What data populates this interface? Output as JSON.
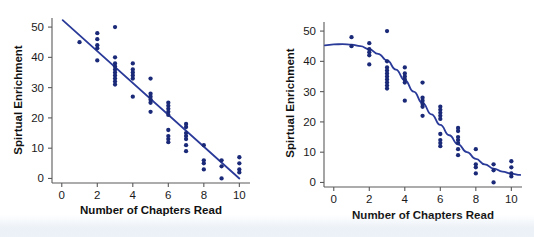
{
  "figure": {
    "background_color": "#ffffff",
    "point_color": "#1b2a78",
    "line_color": "#2a3a99",
    "axis_color": "#5a5a5a"
  },
  "chart_data": [
    {
      "type": "scatter",
      "panel": "left",
      "title": "",
      "xlabel": "Number of Chapters Read",
      "ylabel": "Spirtual Enrichment",
      "xlim": [
        -0.55,
        10.6
      ],
      "ylim": [
        -1.5,
        53
      ],
      "xticks": [
        0,
        2,
        4,
        6,
        8,
        10
      ],
      "yticks": [
        0,
        10,
        20,
        30,
        40,
        50
      ],
      "xtick_labels": [
        "0",
        "2",
        "4",
        "6",
        "8",
        "10"
      ],
      "ytick_labels": [
        "0",
        "10",
        "20",
        "30",
        "40",
        "50"
      ],
      "grid": false,
      "legend": "none",
      "fit": {
        "kind": "line",
        "label": "least-squares straight line",
        "x_start": 0.05,
        "y_start": 52.3,
        "x_end": 10.0,
        "y_end": 0.0,
        "slope": -5.26,
        "intercept": 52.6
      },
      "x": [
        1,
        2,
        2,
        2,
        2,
        2,
        3,
        3,
        3,
        3,
        3,
        3,
        3,
        3,
        3,
        3,
        4,
        4,
        4,
        4,
        4,
        4,
        5,
        5,
        5,
        5,
        5,
        5,
        6,
        6,
        6,
        6,
        6,
        6,
        6,
        6,
        6,
        7,
        7,
        7,
        7,
        7,
        7,
        7,
        8,
        8,
        8,
        8,
        9,
        9,
        9,
        10,
        10,
        10,
        10
      ],
      "y": [
        45,
        48,
        46,
        44,
        43,
        39,
        50,
        40,
        38,
        37,
        36,
        35,
        34,
        33,
        32,
        31,
        38,
        36,
        35,
        34,
        33,
        27,
        33,
        28,
        27,
        26,
        25,
        22,
        25,
        24,
        23,
        22,
        21,
        16,
        14,
        13,
        12,
        18,
        17,
        15,
        14,
        13,
        11,
        9,
        11,
        6,
        5,
        3,
        6,
        4,
        0,
        7,
        5,
        3,
        2
      ]
    },
    {
      "type": "scatter",
      "panel": "right",
      "title": "",
      "xlabel": "Number of Chapters Read",
      "ylabel": "Spirtual Enrichment",
      "xlim": [
        -0.55,
        10.6
      ],
      "ylim": [
        -1.5,
        53
      ],
      "xticks": [
        0,
        2,
        4,
        6,
        8,
        10
      ],
      "yticks": [
        0,
        10,
        20,
        30,
        40,
        50
      ],
      "xtick_labels": [
        "0",
        "2",
        "4",
        "6",
        "8",
        "10"
      ],
      "ytick_labels": [
        "0",
        "10",
        "20",
        "30",
        "40",
        "50"
      ],
      "grid": false,
      "legend": "none",
      "fit": {
        "kind": "logistic-curve",
        "label": "smooth S-shaped (sigmoid) curve",
        "upper_asymptote": 46,
        "lower_asymptote": 2.3,
        "midpoint_x": 5.6,
        "steepness": 0.78,
        "sample_points": [
          [
            -0.5,
            45.3
          ],
          [
            0,
            45.6
          ],
          [
            0.5,
            45.7
          ],
          [
            1,
            45.5
          ],
          [
            1.5,
            45.0
          ],
          [
            2,
            44.0
          ],
          [
            2.5,
            42.5
          ],
          [
            3,
            40.3
          ],
          [
            3.5,
            37.3
          ],
          [
            4,
            33.8
          ],
          [
            4.5,
            30.0
          ],
          [
            5,
            26.2
          ],
          [
            5.5,
            22.5
          ],
          [
            6,
            19.0
          ],
          [
            6.5,
            15.6
          ],
          [
            7,
            12.6
          ],
          [
            7.5,
            10.0
          ],
          [
            8,
            7.8
          ],
          [
            8.5,
            6.0
          ],
          [
            9,
            4.6
          ],
          [
            9.5,
            3.6
          ],
          [
            10,
            2.9
          ],
          [
            10.5,
            2.5
          ]
        ]
      },
      "x": [
        1,
        1,
        2,
        2,
        2,
        2,
        2,
        3,
        3,
        3,
        3,
        3,
        3,
        3,
        3,
        3,
        3,
        4,
        4,
        4,
        4,
        4,
        4,
        5,
        5,
        5,
        5,
        5,
        5,
        6,
        6,
        6,
        6,
        6,
        6,
        6,
        6,
        6,
        7,
        7,
        7,
        7,
        7,
        7,
        7,
        8,
        8,
        8,
        8,
        9,
        9,
        9,
        10,
        10,
        10,
        10
      ],
      "y": [
        48,
        45,
        46,
        44,
        43,
        42,
        39,
        50,
        40,
        38,
        37,
        36,
        35,
        34,
        33,
        32,
        31,
        38,
        36,
        35,
        34,
        33,
        27,
        33,
        28,
        27,
        26,
        25,
        22,
        25,
        24,
        23,
        22,
        21,
        16,
        14,
        13,
        12,
        18,
        17,
        15,
        14,
        13,
        11,
        9,
        11,
        6,
        5,
        3,
        6,
        4,
        0,
        7,
        5,
        3,
        2
      ]
    }
  ]
}
